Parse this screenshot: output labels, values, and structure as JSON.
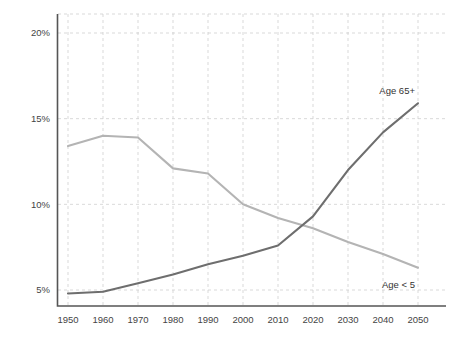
{
  "chart_data": {
    "type": "line",
    "title": "",
    "subtitle": "",
    "xlabel": "",
    "ylabel": "",
    "x": [
      1950,
      1960,
      1970,
      1980,
      1990,
      2000,
      2010,
      2020,
      2030,
      2040,
      2050
    ],
    "categories": [
      "1950",
      "1960",
      "1970",
      "1980",
      "1990",
      "2000",
      "2010",
      "2020",
      "2030",
      "2040",
      "2050"
    ],
    "xlim": [
      1950,
      2050
    ],
    "ylim": [
      5,
      20
    ],
    "y_ticks": [
      5,
      10,
      15,
      20
    ],
    "y_tick_labels": [
      "5%",
      "10%",
      "15%",
      "20%"
    ],
    "grid": true,
    "legend_position": "inline-end-of-line",
    "series": [
      {
        "name": "Age 65+",
        "label": "Age 65+",
        "color": "#6e6e6e",
        "values": [
          4.8,
          4.9,
          5.4,
          5.9,
          6.5,
          7.0,
          7.6,
          9.3,
          12.0,
          14.2,
          15.9
        ]
      },
      {
        "name": "Age < 5",
        "label": "Age < 5",
        "color": "#b4b4b4",
        "values": [
          13.4,
          14.0,
          13.9,
          12.1,
          11.8,
          10.0,
          9.2,
          8.6,
          7.8,
          7.1,
          6.3
        ]
      }
    ],
    "annotations": [
      {
        "text": "Age 65+",
        "series": "Age 65+",
        "at_x": 2050,
        "placement": "above-end"
      },
      {
        "text": "Age < 5",
        "series": "Age < 5",
        "at_x": 2050,
        "placement": "below-end"
      }
    ]
  },
  "colors": {
    "background": "#ffffff",
    "grid": "#cfcfcf",
    "axis": "#555555",
    "tick_text": "#444444",
    "series_old": "#6e6e6e",
    "series_young": "#b4b4b4"
  }
}
